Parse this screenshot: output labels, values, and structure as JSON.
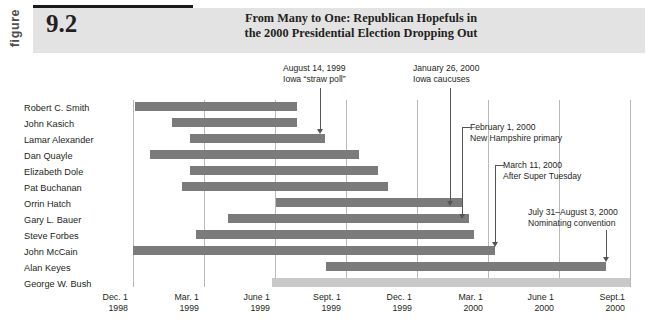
{
  "figure": {
    "label_word": "figure",
    "number": "9.2",
    "title_line1": "From Many to One: Republican Hopefuls in",
    "title_line2": "the 2000 Presidential Election Dropping Out"
  },
  "colors": {
    "bar": "#7b7b7b",
    "bar_light": "#c9c9c9",
    "band": "#e3e3e3",
    "grid": "#b9b9b9",
    "rule": "#1a1a1a"
  },
  "axis": {
    "ticks": [
      {
        "month": "Dec. 1",
        "year": "1998"
      },
      {
        "month": "Mar. 1",
        "year": "1999"
      },
      {
        "month": "June 1",
        "year": "1999"
      },
      {
        "month": "Sept. 1",
        "year": "1999"
      },
      {
        "month": "Dec. 1",
        "year": "1999"
      },
      {
        "month": "Mar. 1",
        "year": "2000"
      },
      {
        "month": "June 1",
        "year": "2000"
      },
      {
        "month": "Sept.1",
        "year": "2000"
      }
    ]
  },
  "chart_data": {
    "type": "bar",
    "orientation": "horizontal",
    "title": "From Many to One: Republican Hopefuls in the 2000 Presidential Election Dropping Out",
    "xlabel": "",
    "ylabel": "",
    "x_axis_type": "date",
    "x_tick_labels": [
      "Dec. 1 1998",
      "Mar. 1 1999",
      "June 1 1999",
      "Sept. 1 1999",
      "Dec. 1 1999",
      "Mar. 1 2000",
      "June 1 2000",
      "Sept.1 2000"
    ],
    "grid": true,
    "legend": "none",
    "categories": [
      "Robert C. Smith",
      "John Kasich",
      "Lamar Alexander",
      "Dan Quayle",
      "Elizabeth Dole",
      "Pat Buchanan",
      "Orrin Hatch",
      "Gary L. Bauer",
      "Steve Forbes",
      "John McCain",
      "Alan Keyes",
      "George W. Bush"
    ],
    "bars": [
      {
        "name": "Robert C. Smith",
        "start_px": 135,
        "end_px": 297,
        "shade": "dark"
      },
      {
        "name": "John Kasich",
        "start_px": 172,
        "end_px": 297,
        "shade": "dark"
      },
      {
        "name": "Lamar Alexander",
        "start_px": 190,
        "end_px": 325,
        "shade": "dark"
      },
      {
        "name": "Dan Quayle",
        "start_px": 150,
        "end_px": 359,
        "shade": "dark"
      },
      {
        "name": "Elizabeth Dole",
        "start_px": 190,
        "end_px": 378,
        "shade": "dark"
      },
      {
        "name": "Pat Buchanan",
        "start_px": 182,
        "end_px": 388,
        "shade": "dark"
      },
      {
        "name": "Orrin Hatch",
        "start_px": 276,
        "end_px": 462,
        "shade": "dark"
      },
      {
        "name": "Gary L. Bauer",
        "start_px": 228,
        "end_px": 469,
        "shade": "dark"
      },
      {
        "name": "Steve Forbes",
        "start_px": 196,
        "end_px": 474,
        "shade": "dark"
      },
      {
        "name": "John McCain",
        "start_px": 133,
        "end_px": 495,
        "shade": "dark"
      },
      {
        "name": "Alan Keyes",
        "start_px": 326,
        "end_px": 606,
        "shade": "dark"
      },
      {
        "name": "George W. Bush",
        "start_px": 272,
        "end_px": 630,
        "shade": "light"
      }
    ]
  },
  "annotations": [
    {
      "id": "iowa-straw-poll",
      "line1": "August 14, 1999",
      "line2": "Iowa “straw poll”",
      "align": "left"
    },
    {
      "id": "iowa-caucuses",
      "line1": "January 26, 2000",
      "line2": "Iowa caucuses",
      "align": "left"
    },
    {
      "id": "new-hampshire-primary",
      "line1": "February 1, 2000",
      "line2": "New Hampshire primary",
      "align": "left"
    },
    {
      "id": "after-super-tuesday",
      "line1": "March 11, 2000",
      "line2": "After Super Tuesday",
      "align": "left"
    },
    {
      "id": "nominating-convention",
      "line1": "July 31–August 3, 2000",
      "line2": "Nominating convention",
      "align": "left"
    }
  ]
}
